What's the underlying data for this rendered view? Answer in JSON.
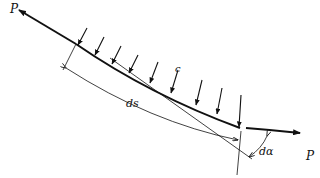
{
  "diagram": {
    "labels": {
      "force_left": "P",
      "force_right": "P",
      "load": "c",
      "arc_length": "ds",
      "angle": "dα"
    },
    "colors": {
      "stroke": "#111111",
      "background": "#ffffff"
    },
    "load_arrow_count": 9
  }
}
